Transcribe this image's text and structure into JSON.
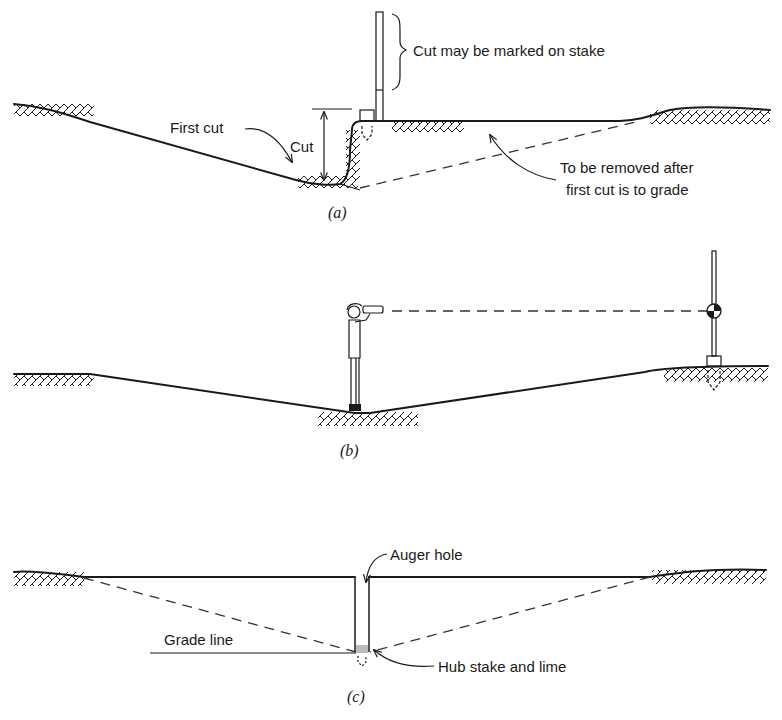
{
  "panels": [
    {
      "id": "a",
      "caption": "(a)",
      "labels": {
        "stake_note": "Cut may be marked on stake",
        "first_cut": "First cut",
        "cut": "Cut",
        "removal_note_line1": "To be removed after",
        "removal_note_line2": "first cut is to grade"
      }
    },
    {
      "id": "b",
      "caption": "(b)"
    },
    {
      "id": "c",
      "caption": "(c)",
      "labels": {
        "auger_hole": "Auger hole",
        "grade_line": "Grade line",
        "hub_stake": "Hub stake and lime"
      }
    }
  ],
  "colors": {
    "ink": "#1a1a1a",
    "background": "#ffffff"
  }
}
